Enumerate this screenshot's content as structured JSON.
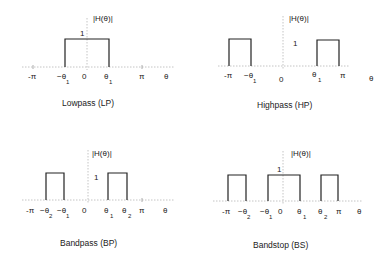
{
  "diagram": {
    "y_axis_label": "|H(θ)|",
    "unit_level": "1",
    "x_axis_label": "θ",
    "panels": [
      {
        "id": "lp",
        "title": "Lowpass  (LP)",
        "ticks": {
          "neg_pi": "-π",
          "neg_t1": "−θ",
          "neg_t1_sub": "1",
          "zero": "0",
          "t1": "θ",
          "t1_sub": "1",
          "pi": "π"
        }
      },
      {
        "id": "hp",
        "title": "Highpass (HP)",
        "ticks": {
          "neg_pi": "-π",
          "neg_t1": "−θ",
          "neg_t1_sub": "1",
          "zero": "0",
          "t1": "θ",
          "t1_sub": "1",
          "pi": "π"
        }
      },
      {
        "id": "bp",
        "title": "Bandpass  (BP)",
        "ticks": {
          "neg_pi": "-π",
          "neg_t2": "−θ",
          "neg_t2_sub": "2",
          "neg_t1": "−θ",
          "neg_t1_sub": "1",
          "zero": "0",
          "t1": "θ",
          "t1_sub": "1",
          "t2": "θ",
          "t2_sub": "2",
          "pi": "π"
        }
      },
      {
        "id": "bs",
        "title": "Bandstop  (BS)",
        "ticks": {
          "neg_pi": "-π",
          "neg_t2": "−θ",
          "neg_t2_sub": "2",
          "neg_t1": "−θ",
          "neg_t1_sub": "1",
          "zero": "0",
          "t1": "θ",
          "t1_sub": "1",
          "t2": "θ",
          "t2_sub": "2",
          "pi": "π"
        }
      }
    ]
  }
}
